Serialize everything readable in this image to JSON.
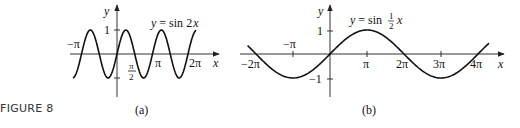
{
  "figure": {
    "label": "FIGURE 8"
  },
  "chart_data": [
    {
      "type": "line",
      "panel": "(a)",
      "title": "y = sin 2x",
      "equation": {
        "lhs": "y",
        "eq": "=",
        "fn": "sin",
        "arg": "2",
        "var": "x"
      },
      "xlabel": "x",
      "ylabel": "y",
      "x_ticks": [
        "−π",
        "π/2",
        "π",
        "2π"
      ],
      "x_tick_values": [
        -3.1416,
        1.5708,
        3.1416,
        6.2832
      ],
      "y_ticks": [
        "1"
      ],
      "y_tick_values": [
        1,
        -1
      ],
      "xlim": [
        -3.9,
        7.0
      ],
      "ylim": [
        -1,
        1
      ],
      "function": "sin(2x)",
      "x": [
        -3.9,
        -3.14,
        -2.36,
        -1.57,
        -0.79,
        0,
        0.79,
        1.57,
        2.36,
        3.14,
        3.93,
        4.71,
        5.5,
        6.28,
        7.0
      ],
      "values": [
        -0.99,
        0,
        1,
        0,
        -1,
        0,
        1,
        0,
        -1,
        0,
        1,
        0,
        -1,
        0,
        0.99
      ],
      "grid": false,
      "labels": {
        "neg_pi": "−π",
        "pi_half_num": "π",
        "pi_half_den": "2",
        "pi": "π",
        "two_pi": "2π",
        "one": "1",
        "x": "x",
        "y": "y",
        "caption": "(a)"
      }
    },
    {
      "type": "line",
      "panel": "(b)",
      "title": "y = sin ½x",
      "equation": {
        "lhs": "y",
        "eq": "=",
        "fn": "sin",
        "frac_num": "1",
        "frac_den": "2",
        "var": "x"
      },
      "xlabel": "x",
      "ylabel": "y",
      "x_ticks": [
        "−2π",
        "−π",
        "π",
        "2π",
        "3π",
        "4π"
      ],
      "x_tick_values": [
        -6.2832,
        -3.1416,
        3.1416,
        6.2832,
        9.4248,
        12.5664
      ],
      "y_ticks": [
        "1",
        "−1"
      ],
      "y_tick_values": [
        1,
        -1
      ],
      "xlim": [
        -7.0,
        13.5
      ],
      "ylim": [
        -1,
        1
      ],
      "function": "sin(x/2)",
      "x": [
        -7.0,
        -6.28,
        -3.14,
        0,
        3.14,
        6.28,
        9.42,
        12.57,
        13.5
      ],
      "values": [
        0.35,
        0,
        -1,
        0,
        1,
        0,
        -1,
        0,
        0.45
      ],
      "grid": false,
      "labels": {
        "neg_two_pi": "−2π",
        "neg_pi": "−π",
        "pi": "π",
        "two_pi": "2π",
        "three_pi": "3π",
        "four_pi": "4π",
        "one": "1",
        "neg_one": "−1",
        "x": "x",
        "y": "y",
        "caption": "(b)"
      }
    }
  ]
}
